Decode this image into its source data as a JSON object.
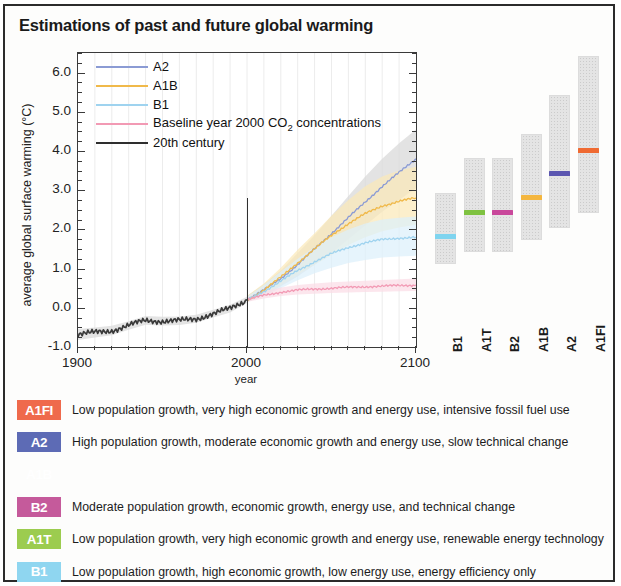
{
  "title": "Estimations of past and future global warming",
  "chart_data": {
    "type": "line",
    "title": "Estimations of past and future global warming",
    "xlabel": "year",
    "ylabel": "average global surface warming (°C)",
    "xlim": [
      1900,
      2100
    ],
    "ylim": [
      -1.0,
      6.5
    ],
    "xticks": [
      1900,
      2000,
      2100
    ],
    "yticks": [
      "-1.0",
      "0.0",
      "1.0",
      "2.0",
      "3.0",
      "4.0",
      "5.0",
      "6.0"
    ],
    "grid": true,
    "legend_position": "top-left",
    "divider_year": 2000,
    "series": [
      {
        "name": "A2",
        "color": "#8b9bd4",
        "band_color": "#d8d8d8",
        "x": [
          2000,
          2010,
          2020,
          2030,
          2040,
          2050,
          2060,
          2070,
          2080,
          2090,
          2100
        ],
        "values": [
          0.2,
          0.45,
          0.75,
          1.1,
          1.5,
          1.9,
          2.3,
          2.7,
          3.1,
          3.45,
          3.8
        ],
        "band_low": [
          0.15,
          0.3,
          0.55,
          0.8,
          1.1,
          1.4,
          1.75,
          2.1,
          2.45,
          2.75,
          3.05
        ],
        "band_high": [
          0.3,
          0.6,
          0.95,
          1.4,
          1.85,
          2.35,
          2.85,
          3.35,
          3.8,
          4.2,
          4.55
        ]
      },
      {
        "name": "A1B",
        "color": "#f0b94a",
        "band_color": "#fbe9b8",
        "x": [
          2000,
          2010,
          2020,
          2030,
          2040,
          2050,
          2060,
          2070,
          2080,
          2090,
          2100
        ],
        "values": [
          0.2,
          0.45,
          0.78,
          1.15,
          1.5,
          1.85,
          2.15,
          2.4,
          2.6,
          2.72,
          2.8
        ],
        "band_low": [
          0.15,
          0.32,
          0.58,
          0.85,
          1.1,
          1.35,
          1.6,
          1.8,
          1.95,
          2.05,
          2.12
        ],
        "band_high": [
          0.3,
          0.62,
          1.02,
          1.48,
          1.9,
          2.35,
          2.75,
          3.1,
          3.35,
          3.5,
          3.6
        ]
      },
      {
        "name": "B1",
        "color": "#9fd3ef",
        "band_color": "#ddf0fb",
        "x": [
          2000,
          2010,
          2020,
          2030,
          2040,
          2050,
          2060,
          2070,
          2080,
          2090,
          2100
        ],
        "values": [
          0.2,
          0.42,
          0.68,
          0.95,
          1.18,
          1.38,
          1.54,
          1.66,
          1.74,
          1.78,
          1.8
        ],
        "band_low": [
          0.15,
          0.3,
          0.5,
          0.7,
          0.88,
          1.02,
          1.14,
          1.22,
          1.28,
          1.31,
          1.33
        ],
        "band_high": [
          0.28,
          0.58,
          0.92,
          1.25,
          1.55,
          1.8,
          2.0,
          2.15,
          2.25,
          2.3,
          2.33
        ]
      },
      {
        "name": "Baseline year 2000 CO2 concentrations",
        "color": "#f29ab4",
        "band_color": "#fbdde6",
        "x": [
          2000,
          2010,
          2020,
          2030,
          2040,
          2050,
          2060,
          2070,
          2080,
          2090,
          2100
        ],
        "values": [
          0.2,
          0.32,
          0.4,
          0.45,
          0.48,
          0.5,
          0.52,
          0.54,
          0.55,
          0.57,
          0.58
        ],
        "band_low": [
          0.15,
          0.24,
          0.3,
          0.34,
          0.36,
          0.38,
          0.39,
          0.4,
          0.41,
          0.42,
          0.43
        ],
        "band_high": [
          0.26,
          0.42,
          0.52,
          0.58,
          0.62,
          0.65,
          0.67,
          0.69,
          0.71,
          0.73,
          0.75
        ]
      },
      {
        "name": "20th century",
        "color": "#3a3a3a",
        "band_color": "#d9d9d9",
        "x": [
          1900,
          1910,
          1920,
          1930,
          1940,
          1950,
          1960,
          1970,
          1980,
          1990,
          2000
        ],
        "values": [
          -0.68,
          -0.63,
          -0.58,
          -0.45,
          -0.32,
          -0.34,
          -0.33,
          -0.28,
          -0.15,
          -0.02,
          0.2
        ],
        "band_low": [
          -0.82,
          -0.76,
          -0.7,
          -0.56,
          -0.43,
          -0.45,
          -0.44,
          -0.38,
          -0.25,
          -0.12,
          0.12
        ],
        "band_high": [
          -0.54,
          -0.5,
          -0.46,
          -0.34,
          -0.21,
          -0.23,
          -0.22,
          -0.18,
          -0.05,
          0.08,
          0.28
        ]
      }
    ],
    "ranges": {
      "ylabel_right": "average global surface warming (°C)",
      "categories": [
        "B1",
        "A1T",
        "B2",
        "A1B",
        "A2",
        "A1FI"
      ],
      "bars": [
        {
          "name": "B1",
          "low": 1.1,
          "high": 2.9,
          "best": 1.8,
          "color": "#7fd4ef"
        },
        {
          "name": "A1T",
          "low": 1.4,
          "high": 3.8,
          "best": 2.4,
          "color": "#7fc241"
        },
        {
          "name": "B2",
          "low": 1.4,
          "high": 3.8,
          "best": 2.4,
          "color": "#c9489b"
        },
        {
          "name": "A1B",
          "low": 1.7,
          "high": 4.4,
          "best": 2.8,
          "color": "#f4b63f"
        },
        {
          "name": "A2",
          "low": 2.0,
          "high": 5.4,
          "best": 3.4,
          "color": "#5b56b0"
        },
        {
          "name": "A1FI",
          "low": 2.4,
          "high": 6.4,
          "best": 4.0,
          "color": "#ef6a32"
        }
      ]
    }
  },
  "legend": [
    {
      "label": "A2",
      "color": "#8b9bd4"
    },
    {
      "label": "A1B",
      "color": "#f0b94a"
    },
    {
      "label": "B1",
      "color": "#9fd3ef"
    },
    {
      "label": "Baseline year 2000 CO2 concentrations",
      "color": "#f29ab4",
      "has_subscript": true
    },
    {
      "label": "20th century",
      "color": "#2e2e2e"
    }
  ],
  "scenarios": [
    {
      "code": "A1FI",
      "color": "#ef6a4c",
      "description": "Low population growth, very high economic growth and energy use, intensive fossil fuel use"
    },
    {
      "code": "A2",
      "color": "#5d6bb5",
      "description": "High population growth, moderate economic growth and energy use, slow technical change"
    },
    {
      "code": "A1B",
      "color": "#f5c košile"
    },
    {
      "code": "B2",
      "color": "#c55a9b",
      "description": "Moderate population growth, economic growth, energy use, and technical change"
    },
    {
      "code": "A1T",
      "color": "#9ccc4f",
      "description": "Low population growth, very high economic growth and energy use, renewable energy technology"
    },
    {
      "code": "B1",
      "color": "#8fd6f0",
      "description": "Low population growth, high economic growth, low energy use, energy efficiency only"
    }
  ]
}
